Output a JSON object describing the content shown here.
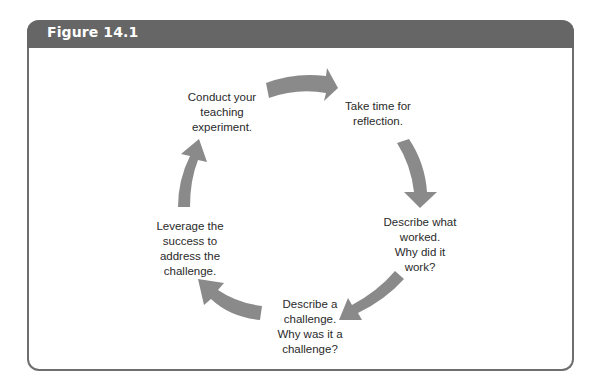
{
  "figure": {
    "title": "Figure 14.1",
    "header_color": "#666666",
    "arrow_color": "#8a8a8a"
  },
  "cycle": {
    "steps": [
      {
        "id": "conduct",
        "label": "Conduct your\nteaching\nexperiment."
      },
      {
        "id": "reflect",
        "label": "Take time for\nreflection."
      },
      {
        "id": "worked",
        "label": "Describe what\nworked.\nWhy did it\nwork?"
      },
      {
        "id": "challenge",
        "label": "Describe a\nchallenge.\nWhy was it a\nchallenge?"
      },
      {
        "id": "leverage",
        "label": "Leverage the\nsuccess to\naddress the\nchallenge."
      }
    ],
    "arrows": [
      {
        "from": "conduct",
        "to": "reflect",
        "icon": "curved-arrow-right-icon"
      },
      {
        "from": "reflect",
        "to": "worked",
        "icon": "curved-arrow-down-icon"
      },
      {
        "from": "worked",
        "to": "challenge",
        "icon": "curved-arrow-down-left-icon"
      },
      {
        "from": "challenge",
        "to": "leverage",
        "icon": "curved-arrow-up-left-icon"
      },
      {
        "from": "leverage",
        "to": "conduct",
        "icon": "curved-arrow-up-icon"
      }
    ]
  }
}
